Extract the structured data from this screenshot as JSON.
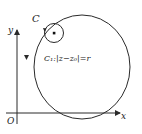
{
  "figure": {
    "labels": {
      "contour_outer": "C",
      "contour_inner": "C₁:|z−z₀|=r",
      "x_axis": "x",
      "y_axis": "y",
      "origin": "O"
    },
    "orientation": {
      "outer": "counter-clockwise",
      "inner": "counter-clockwise"
    },
    "colors": {
      "stroke": "#2a2a2a",
      "background": "#ffffff"
    }
  }
}
